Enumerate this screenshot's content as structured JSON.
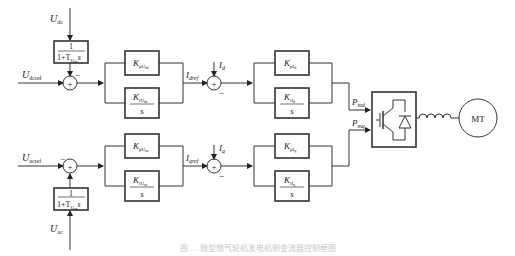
{
  "diagram": {
    "type": "control-block-diagram",
    "top_loop": {
      "measured_input": {
        "sym": "U",
        "sub": "dc"
      },
      "filter_block": {
        "num": "1",
        "den_prefix": "1+T",
        "den_sub": "U",
        "den_subsub": "dc",
        "den_suffix": "s"
      },
      "reference_input": {
        "sym": "U",
        "sub": "dcref"
      },
      "sum1_sign": "+",
      "sum1_minus": "−",
      "pi_outer_p": {
        "sym": "K",
        "sub": "pU",
        "subsub": "dc"
      },
      "pi_outer_i": {
        "sym": "K",
        "sub": "iU",
        "subsub": "dc",
        "den": "s"
      },
      "outer_output": {
        "sym": "I",
        "sub": "dref"
      },
      "feedback": {
        "sym": "I",
        "sub": "d"
      },
      "sum2_sign": "+",
      "sum2_minus": "−",
      "pi_inner_p": {
        "sym": "K",
        "sub": "pI",
        "subsub": "d"
      },
      "pi_inner_i": {
        "sym": "K",
        "sub": "iI",
        "subsub": "d",
        "den": "s"
      },
      "inner_output": {
        "sym": "P",
        "sub": "md"
      }
    },
    "bottom_loop": {
      "measured_input": {
        "sym": "U",
        "sub": "ac"
      },
      "filter_block": {
        "num": "1",
        "den_prefix": "1+T",
        "den_sub": "U",
        "den_subsub": "ac",
        "den_suffix": "s"
      },
      "reference_input": {
        "sym": "U",
        "sub": "acref"
      },
      "sum1_sign": "+",
      "sum1_minus": "−",
      "pi_outer_p": {
        "sym": "K",
        "sub": "pU",
        "subsub": "ac"
      },
      "pi_outer_i": {
        "sym": "K",
        "sub": "iU",
        "subsub": "ac",
        "den": "s"
      },
      "outer_output": {
        "sym": "I",
        "sub": "qref"
      },
      "feedback": {
        "sym": "I",
        "sub": "q"
      },
      "sum2_sign": "+",
      "sum2_minus": "−",
      "pi_inner_p": {
        "sym": "K",
        "sub": "pI",
        "subsub": "q"
      },
      "pi_inner_i": {
        "sym": "K",
        "sub": "iI",
        "subsub": "q",
        "den": "s"
      },
      "inner_output": {
        "sym": "P",
        "sub": "mq"
      }
    },
    "converter": {
      "icon": "igbt-diode-icon"
    },
    "inductor": {
      "icon": "inductor-icon"
    },
    "machine": {
      "label": "MT"
    },
    "caption": "图 … 微型燃气轮机发电机侧变流器控制框图"
  }
}
